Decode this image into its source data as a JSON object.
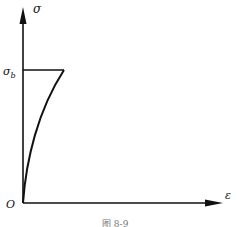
{
  "diagram": {
    "y_axis_label": "σ",
    "x_axis_label": "ε",
    "origin_label": "O",
    "level_label_main": "σ",
    "level_label_sub": "b",
    "caption": "图 8-9"
  },
  "colors": {
    "line": "#111111",
    "background": "#ffffff",
    "caption": "#777777"
  }
}
